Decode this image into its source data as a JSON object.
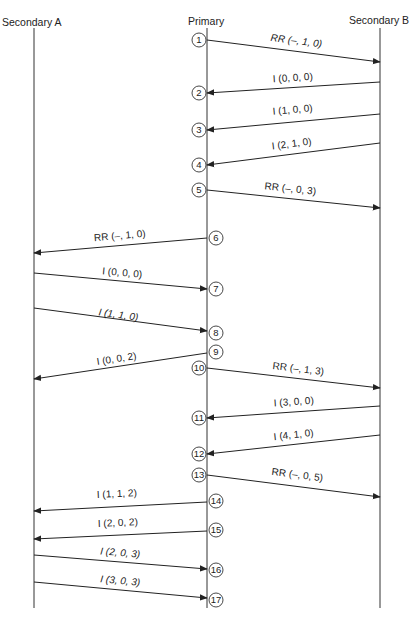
{
  "headers": {
    "secondary_a": "Secondary A",
    "primary": "Primary",
    "secondary_b": "Secondary B"
  },
  "lifelines": {
    "a_x": 34,
    "p_x": 207,
    "b_x": 380,
    "top": 28,
    "bottom": 608
  },
  "colors": {
    "line": "#222222",
    "background": "#ffffff"
  },
  "steps": [
    {
      "n": "1",
      "cy": 40,
      "side": "left"
    },
    {
      "n": "2",
      "cy": 93,
      "side": "left"
    },
    {
      "n": "3",
      "cy": 130,
      "side": "left"
    },
    {
      "n": "4",
      "cy": 165,
      "side": "left"
    },
    {
      "n": "5",
      "cy": 190,
      "side": "left"
    },
    {
      "n": "6",
      "cy": 238,
      "side": "right"
    },
    {
      "n": "7",
      "cy": 289,
      "side": "right"
    },
    {
      "n": "8",
      "cy": 333,
      "side": "right"
    },
    {
      "n": "9",
      "cy": 352,
      "side": "right"
    },
    {
      "n": "10",
      "cy": 368,
      "side": "left"
    },
    {
      "n": "11",
      "cy": 418,
      "side": "left"
    },
    {
      "n": "12",
      "cy": 454,
      "side": "left"
    },
    {
      "n": "13",
      "cy": 475,
      "side": "left"
    },
    {
      "n": "14",
      "cy": 501,
      "side": "right"
    },
    {
      "n": "15",
      "cy": 530,
      "side": "right"
    },
    {
      "n": "16",
      "cy": 570,
      "side": "right"
    },
    {
      "n": "17",
      "cy": 600,
      "side": "right"
    }
  ],
  "messages": [
    {
      "label": "RR (–, 1, 0)",
      "x1": 207,
      "y1": 40,
      "x2": 380,
      "y2": 62,
      "lx": 296,
      "ly": 44,
      "italic": true
    },
    {
      "label": "I (0, 0, 0)",
      "x1": 380,
      "y1": 82,
      "x2": 207,
      "y2": 93,
      "lx": 293,
      "ly": 81,
      "italic": false
    },
    {
      "label": "I (1, 0, 0)",
      "x1": 380,
      "y1": 114,
      "x2": 207,
      "y2": 130,
      "lx": 293,
      "ly": 113,
      "italic": false
    },
    {
      "label": "I (2, 1, 0)",
      "x1": 380,
      "y1": 143,
      "x2": 207,
      "y2": 165,
      "lx": 292,
      "ly": 147,
      "italic": false
    },
    {
      "label": "RR (–, 0, 3)",
      "x1": 207,
      "y1": 190,
      "x2": 380,
      "y2": 208,
      "lx": 290,
      "ly": 192,
      "italic": false
    },
    {
      "label": "RR (–, 1, 0)",
      "x1": 207,
      "y1": 238,
      "x2": 34,
      "y2": 253,
      "lx": 120,
      "ly": 239,
      "italic": false
    },
    {
      "label": "I (0, 0, 0)",
      "x1": 34,
      "y1": 273,
      "x2": 207,
      "y2": 289,
      "lx": 122,
      "ly": 276,
      "italic": false
    },
    {
      "label": "I (1, 1, 0)",
      "x1": 34,
      "y1": 308,
      "x2": 207,
      "y2": 331,
      "lx": 118,
      "ly": 318,
      "italic": true
    },
    {
      "label": "I (0, 0, 2)",
      "x1": 207,
      "y1": 353,
      "x2": 34,
      "y2": 379,
      "lx": 117,
      "ly": 362,
      "italic": false
    },
    {
      "label": "RR (–, 1, 3)",
      "x1": 207,
      "y1": 368,
      "x2": 380,
      "y2": 388,
      "lx": 298,
      "ly": 372,
      "italic": false
    },
    {
      "label": "I (3, 0, 0)",
      "x1": 380,
      "y1": 406,
      "x2": 207,
      "y2": 418,
      "lx": 294,
      "ly": 405,
      "italic": false
    },
    {
      "label": "I (4, 1, 0)",
      "x1": 380,
      "y1": 435,
      "x2": 207,
      "y2": 454,
      "lx": 294,
      "ly": 438,
      "italic": false
    },
    {
      "label": "RR (–, 0, 5)",
      "x1": 207,
      "y1": 475,
      "x2": 380,
      "y2": 497,
      "lx": 297,
      "ly": 478,
      "italic": false
    },
    {
      "label": "I (1, 1, 2)",
      "x1": 207,
      "y1": 502,
      "x2": 34,
      "y2": 511,
      "lx": 117,
      "ly": 497,
      "italic": false
    },
    {
      "label": "I (2, 0, 2)",
      "x1": 207,
      "y1": 531,
      "x2": 34,
      "y2": 539,
      "lx": 118,
      "ly": 526,
      "italic": false
    },
    {
      "label": "I (2, 0, 3)",
      "x1": 34,
      "y1": 555,
      "x2": 207,
      "y2": 569,
      "lx": 120,
      "ly": 556,
      "italic": true
    },
    {
      "label": "I (3, 0, 3)",
      "x1": 34,
      "y1": 582,
      "x2": 207,
      "y2": 598,
      "lx": 120,
      "ly": 584,
      "italic": true
    }
  ]
}
